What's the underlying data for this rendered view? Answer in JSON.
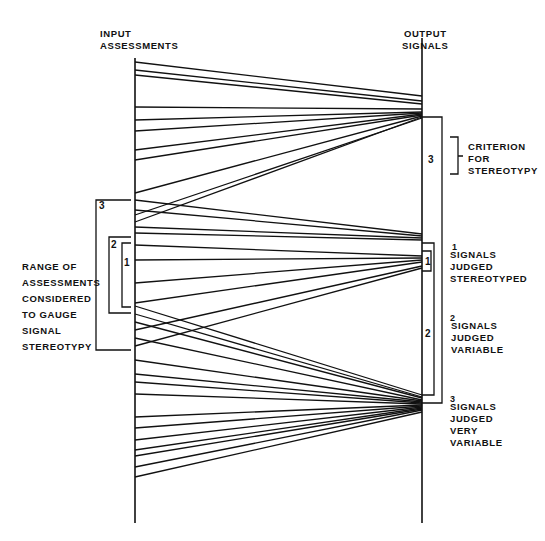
{
  "headers": {
    "input": "INPUT\nASSESSMENTS",
    "output": "OUTPUT\nSIGNALS"
  },
  "left_annotation": {
    "text": "RANGE OF\nASSESSMENTS\nCONSIDERED\nTO GAUGE\nSIGNAL\nSTEREOTYPY",
    "brackets": [
      {
        "label": "3",
        "top": 200,
        "bottom": 350
      },
      {
        "label": "2",
        "top": 237,
        "bottom": 313
      },
      {
        "label": "1",
        "top": 243,
        "bottom": 307
      }
    ]
  },
  "right_annotations": {
    "criterion": "CRITERION\nFOR\nSTEREOTYPY",
    "box3_label": "3",
    "box2_label": "2",
    "box1_label": "1",
    "legend": [
      {
        "sup": "1",
        "text": "SIGNALS\nJUDGED\nSTEREOTYPED"
      },
      {
        "sup": "2",
        "text": "SIGNALS\nJUDGED\nVARIABLE"
      },
      {
        "sup": "3",
        "text": "SIGNALS\nJUDGED\nVERY\nVARIABLE"
      }
    ]
  },
  "axes": {
    "left_x": 135,
    "right_x": 422,
    "left_top": 58,
    "left_bottom": 523,
    "right_top": 38,
    "right_bottom": 523
  },
  "connections": [
    {
      "from": 62,
      "to": 96
    },
    {
      "from": 70,
      "to": 101
    },
    {
      "from": 75,
      "to": 104
    },
    {
      "from": 107,
      "to": 109
    },
    {
      "from": 120,
      "to": 112
    },
    {
      "from": 131,
      "to": 113
    },
    {
      "from": 150,
      "to": 114
    },
    {
      "from": 160,
      "to": 115
    },
    {
      "from": 193,
      "to": 116
    },
    {
      "from": 215,
      "to": 118
    },
    {
      "from": 222,
      "to": 117
    },
    {
      "from": 200,
      "to": 234
    },
    {
      "from": 210,
      "to": 236
    },
    {
      "from": 227,
      "to": 238
    },
    {
      "from": 233,
      "to": 240
    },
    {
      "from": 245,
      "to": 256
    },
    {
      "from": 260,
      "to": 258
    },
    {
      "from": 283,
      "to": 260
    },
    {
      "from": 303,
      "to": 262
    },
    {
      "from": 330,
      "to": 266
    },
    {
      "from": 346,
      "to": 268
    },
    {
      "from": 306,
      "to": 395
    },
    {
      "from": 314,
      "to": 397
    },
    {
      "from": 322,
      "to": 398
    },
    {
      "from": 338,
      "to": 400
    },
    {
      "from": 360,
      "to": 401
    },
    {
      "from": 374,
      "to": 402
    },
    {
      "from": 382,
      "to": 403
    },
    {
      "from": 394,
      "to": 404
    },
    {
      "from": 417,
      "to": 405
    },
    {
      "from": 428,
      "to": 406
    },
    {
      "from": 440,
      "to": 407
    },
    {
      "from": 450,
      "to": 408
    },
    {
      "from": 456,
      "to": 409
    },
    {
      "from": 467,
      "to": 410
    },
    {
      "from": 477,
      "to": 412
    }
  ]
}
